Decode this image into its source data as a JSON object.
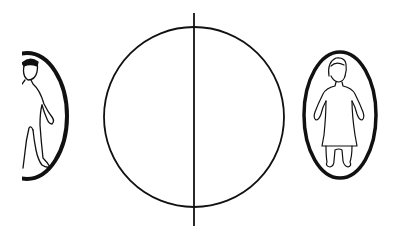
{
  "diagram": {
    "background": "#ffffff",
    "stroke_color": "#111111",
    "central_circle": {
      "cx": 194,
      "cy": 117,
      "r": 90,
      "stroke_width": 1.8
    },
    "vertical_line": {
      "x": 194,
      "y1": 13,
      "y2": 226,
      "stroke_width": 1.8
    },
    "left_figure": {
      "description": "person figure in oval, partially cropped at left edge",
      "oval": {
        "cx": 27,
        "cy": 116,
        "rx": 40,
        "ry": 63,
        "stroke_width": 4
      },
      "clip_x": 22
    },
    "right_figure": {
      "description": "person figure in dress inside oval",
      "oval": {
        "cx": 340,
        "cy": 115,
        "rx": 36,
        "ry": 63,
        "stroke_width": 3.5
      }
    }
  }
}
